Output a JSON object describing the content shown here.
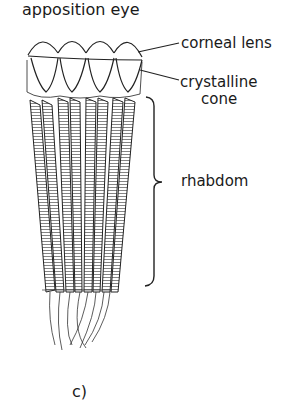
{
  "figure": {
    "title": "apposition eye",
    "panel_label": "c)"
  },
  "labels": {
    "corneal_lens": "corneal lens",
    "crystalline_cone_line1": "crystalline",
    "crystalline_cone_line2": "cone",
    "rhabdom": "rhabdom"
  },
  "structure": {
    "ommatidia_count": 4,
    "parts": [
      "corneal lens",
      "crystalline cone",
      "rhabdom"
    ]
  },
  "colors": {
    "ink": "#1a1a1a",
    "background": "#ffffff"
  }
}
